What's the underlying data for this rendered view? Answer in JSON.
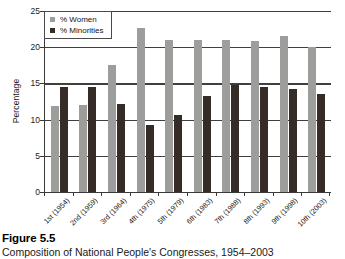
{
  "figure": {
    "number_label": "Figure 5.5",
    "caption": "Composition of National People's Congresses, 1954–2003"
  },
  "legend": {
    "position": "top-left-inside",
    "entries": [
      {
        "label": "% Women",
        "color": "#9d9d9b",
        "swatch": "square-swatch"
      },
      {
        "label": "% Minorities",
        "color": "#352c28",
        "swatch": "square-swatch"
      }
    ]
  },
  "axes": {
    "y_title": "Percentage",
    "y_ticks": [
      "0",
      "5",
      "10",
      "15",
      "20",
      "25"
    ]
  },
  "chart_data": {
    "type": "bar",
    "title": "Composition of National People's Congresses, 1954–2003",
    "xlabel": "",
    "ylabel": "Percentage",
    "ylim": [
      0,
      25
    ],
    "yticks": [
      0,
      5,
      10,
      15,
      20,
      25
    ],
    "grid": true,
    "legend_position": "upper left",
    "categories": [
      "1st (1954)",
      "2nd (1959)",
      "3rd (1964)",
      "4th (1975)",
      "5th (1979)",
      "6th (1983)",
      "7th (1988)",
      "8th (1993)",
      "9th (1998)",
      "10th (2003)"
    ],
    "series": [
      {
        "name": "% Women",
        "color": "#9d9d9b",
        "values": [
          11.9,
          12.0,
          17.6,
          22.6,
          21.0,
          21.0,
          21.0,
          20.8,
          21.5,
          20.0
        ]
      },
      {
        "name": "% Minorities",
        "color": "#352c28",
        "values": [
          14.5,
          14.5,
          12.1,
          9.3,
          10.7,
          13.3,
          14.8,
          14.5,
          14.2,
          13.6
        ]
      }
    ]
  }
}
